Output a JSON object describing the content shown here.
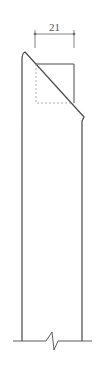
{
  "drawing": {
    "type": "section-detail",
    "dimension": {
      "value": "21"
    },
    "colors": {
      "line": "#4a4a4a",
      "dashed": "#9a9a9a",
      "dim": "#666666"
    }
  }
}
